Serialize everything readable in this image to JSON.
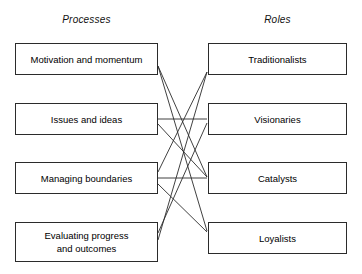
{
  "figure": {
    "type": "bipartite-mapping-diagram",
    "background_color": "#ffffff",
    "line_color": "#2b2b2b",
    "box_border_color": "#2b2b2b",
    "text_color": "#000000"
  },
  "columns": {
    "left": {
      "heading": "Processes"
    },
    "right": {
      "heading": "Roles"
    }
  },
  "left_nodes": [
    {
      "id": "motivation",
      "label": "Motivation and momentum",
      "x": 15,
      "y": 43,
      "w": 143,
      "h": 32
    },
    {
      "id": "issues",
      "label": "Issues and ideas",
      "x": 15,
      "y": 103,
      "w": 143,
      "h": 32
    },
    {
      "id": "boundaries",
      "label": "Managing boundaries",
      "x": 15,
      "y": 162,
      "w": 143,
      "h": 32
    },
    {
      "id": "evaluating",
      "label": "Evaluating progress\nand outcomes",
      "x": 15,
      "y": 222,
      "w": 143,
      "h": 40
    }
  ],
  "right_nodes": [
    {
      "id": "traditionalists",
      "label": "Traditionalists",
      "x": 208,
      "y": 43,
      "w": 139,
      "h": 32
    },
    {
      "id": "visionaries",
      "label": "Visionaries",
      "x": 208,
      "y": 103,
      "w": 139,
      "h": 32
    },
    {
      "id": "catalysts",
      "label": "Catalysts",
      "x": 208,
      "y": 162,
      "w": 139,
      "h": 32
    },
    {
      "id": "loyalists",
      "label": "Loyalists",
      "x": 208,
      "y": 222,
      "w": 139,
      "h": 32
    }
  ],
  "links": [
    {
      "from": "motivation",
      "to": "catalysts",
      "x1": 158,
      "y1": 66,
      "x2": 207,
      "y2": 177
    },
    {
      "from": "motivation",
      "to": "loyalists",
      "x1": 158,
      "y1": 66,
      "x2": 207,
      "y2": 231
    },
    {
      "from": "issues",
      "to": "visionaries",
      "x1": 158,
      "y1": 119,
      "x2": 207,
      "y2": 119
    },
    {
      "from": "issues",
      "to": "catalysts",
      "x1": 158,
      "y1": 124,
      "x2": 207,
      "y2": 177
    },
    {
      "from": "boundaries",
      "to": "catalysts",
      "x1": 158,
      "y1": 178,
      "x2": 207,
      "y2": 178
    },
    {
      "from": "boundaries",
      "to": "traditionalists",
      "x1": 158,
      "y1": 172,
      "x2": 207,
      "y2": 72
    },
    {
      "from": "boundaries",
      "to": "loyalists",
      "x1": 158,
      "y1": 184,
      "x2": 207,
      "y2": 232
    },
    {
      "from": "evaluating",
      "to": "traditionalists",
      "x1": 158,
      "y1": 240,
      "x2": 207,
      "y2": 72
    },
    {
      "from": "evaluating",
      "to": "visionaries",
      "x1": 158,
      "y1": 233,
      "x2": 207,
      "y2": 123
    }
  ]
}
